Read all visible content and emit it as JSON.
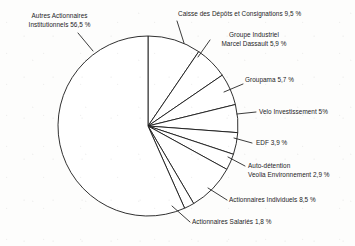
{
  "chart_data": {
    "type": "pie",
    "title": "",
    "subtitle": "",
    "xlabel": "",
    "ylabel": "",
    "legend_position": "none",
    "grid": false,
    "unit": "%",
    "start_angle_deg": -90,
    "direction": "clockwise",
    "center": {
      "x": 148,
      "y": 126
    },
    "radius": 90,
    "categories": [
      "Autres Actionnaires Institutionnels",
      "Caisse des Dépôts et Consignations",
      "Groupe Industriel Marcel Dassault",
      "Groupama",
      "Velo Investissement",
      "EDF",
      "Auto-détention Veolia Environnement",
      "Actionnaires Individuels",
      "Actionnaires Salariés"
    ],
    "values": [
      56.5,
      9.5,
      5.9,
      5.7,
      5.0,
      3.9,
      2.9,
      8.5,
      1.8
    ],
    "value_labels": [
      "56,5 %",
      "9,5 %",
      "5,9 %",
      "5,7 %",
      "5%",
      "3,9 %",
      "2,9 %",
      "8,5 %",
      "1,8 %"
    ],
    "slices": [
      {
        "name": "Caisse des Dépôts et Consignations",
        "value": 9.5,
        "value_label": "9,5 %"
      },
      {
        "name": "Groupe Industriel Marcel Dassault",
        "value": 5.9,
        "value_label": "5,9 %"
      },
      {
        "name": "Groupama",
        "value": 5.7,
        "value_label": "5,7 %"
      },
      {
        "name": "Velo Investissement",
        "value": 5.0,
        "value_label": "5%"
      },
      {
        "name": "EDF",
        "value": 3.9,
        "value_label": "3,9 %"
      },
      {
        "name": "Auto-détention Veolia Environnement",
        "value": 2.9,
        "value_label": "2,9 %"
      },
      {
        "name": "Actionnaires Individuels",
        "value": 8.5,
        "value_label": "8,5 %"
      },
      {
        "name": "Actionnaires Salariés",
        "value": 1.8,
        "value_label": "1,8 %"
      },
      {
        "name": "Autres Actionnaires Institutionnels",
        "value": 56.5,
        "value_label": "56,5 %"
      }
    ],
    "colors": {
      "slice_fill": "#ffffff",
      "slice_stroke": "#1a1a1a",
      "text": "#1c1c1c",
      "background": "#fdfdfc"
    }
  },
  "labels": {
    "autres_line1": "Autres Actionnaires",
    "autres_line2": "Institutionnels 56,5 %",
    "caisse": "Caisse des Dépôts et Consignations 9,5 %",
    "dassault_line1": "Groupe Industriel",
    "dassault_line2": "Marcel Dassault 5,9 %",
    "groupama": "Groupama 5,7 %",
    "velo": "Velo Investissement 5%",
    "edf": "EDF 3,9 %",
    "veolia_line1": "Auto-détention",
    "veolia_line2": "Veolia Environnement 2,9 %",
    "individuels": "Actionnaires Individuels 8,5 %",
    "salaries": "Actionnaires Salariés 1,8 %"
  }
}
